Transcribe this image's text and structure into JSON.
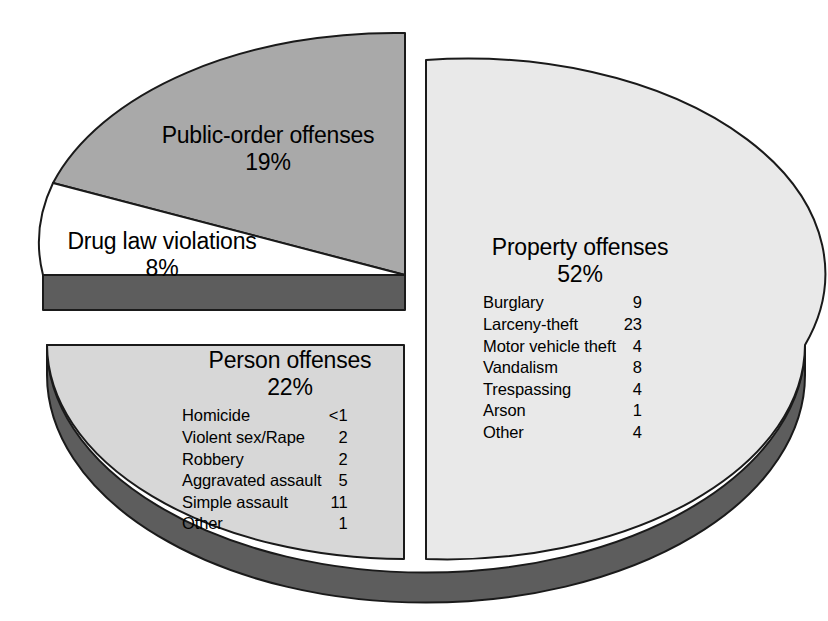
{
  "chart_data": {
    "type": "pie",
    "title": "",
    "exploded_slices": [
      "Public-order offenses",
      "Drug law violations"
    ],
    "legend": "none",
    "style": "3d-exploded-pie",
    "categories": [
      "Property offenses",
      "Person offenses",
      "Public-order offenses",
      "Drug law violations"
    ],
    "values": [
      52,
      22,
      19,
      8
    ],
    "unit": "percent",
    "slices": [
      {
        "name": "Property offenses",
        "percent_label": "52%",
        "value": 52,
        "color": "#e9e9e9",
        "side_color": "#5d5d5d",
        "breakdown": [
          {
            "label": "Burglary",
            "value": "9"
          },
          {
            "label": "Larceny-theft",
            "value": "23"
          },
          {
            "label": "Motor vehicle theft",
            "value": "4"
          },
          {
            "label": "Vandalism",
            "value": "8"
          },
          {
            "label": "Trespassing",
            "value": "4"
          },
          {
            "label": "Arson",
            "value": "1"
          },
          {
            "label": "Other",
            "value": "4"
          }
        ]
      },
      {
        "name": "Person offenses",
        "percent_label": "22%",
        "value": 22,
        "color": "#d7d7d7",
        "side_color": "#5d5d5d",
        "breakdown": [
          {
            "label": "Homicide",
            "value": "<1"
          },
          {
            "label": "Violent sex/Rape",
            "value": "2"
          },
          {
            "label": "Robbery",
            "value": "2"
          },
          {
            "label": "Aggravated assault",
            "value": "5"
          },
          {
            "label": "Simple assault",
            "value": "11"
          },
          {
            "label": "Other",
            "value": "1"
          }
        ]
      },
      {
        "name": "Public-order offenses",
        "percent_label": "19%",
        "value": 19,
        "color": "#a9a9a9",
        "side_color": "#5d5d5d",
        "breakdown": []
      },
      {
        "name": "Drug law violations",
        "percent_label": "8%",
        "value": 8,
        "color": "#ffffff",
        "side_color": "#5d5d5d",
        "breakdown": []
      }
    ]
  },
  "labels": {
    "public_order": {
      "title": "Public-order offenses",
      "percent": "19%"
    },
    "drug": {
      "title": "Drug law violations",
      "percent": "8%"
    },
    "property": {
      "title": "Property offenses",
      "percent": "52%"
    },
    "person": {
      "title": "Person offenses",
      "percent": "22%"
    }
  },
  "colors": {
    "background": "#ffffff",
    "outline": "#1a1a1a",
    "property_fill": "#e9e9e9",
    "person_fill": "#d7d7d7",
    "public_order_fill": "#a9a9a9",
    "drug_fill": "#ffffff",
    "side_wall": "#5d5d5d",
    "text": "#000000"
  }
}
